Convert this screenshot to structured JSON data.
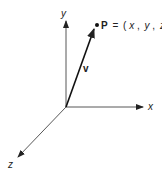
{
  "diagram": {
    "axes": {
      "x_label": "x",
      "y_label": "y",
      "z_label": "z"
    },
    "vector": {
      "label": "v"
    },
    "point": {
      "name": "P",
      "equals": "=",
      "coords_open": "(",
      "coord_x": "x",
      "coord_y": "y",
      "coord_z": "z",
      "coords_close": ")",
      "separator": ","
    },
    "colors": {
      "ink": "#222222",
      "background": "#ffffff"
    }
  }
}
